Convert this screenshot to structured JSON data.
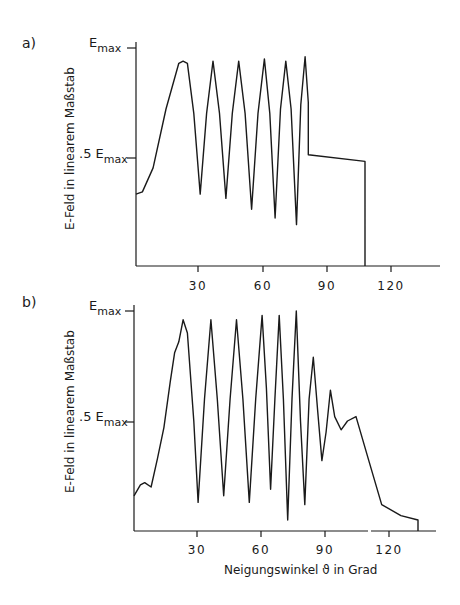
{
  "figure": {
    "panel_a": {
      "label": "a)",
      "y_axis_label": "E-Feld in linearem Maßstab",
      "y_tick_top": "E",
      "y_tick_top_sub": "max",
      "y_tick_mid": ".5 E",
      "y_tick_mid_sub": "max",
      "x_ticks": [
        "30",
        "60",
        "90",
        "120"
      ]
    },
    "panel_b": {
      "label": "b)",
      "y_axis_label": "E-Feld in linearem Maßstab",
      "y_tick_top": "E",
      "y_tick_top_sub": "max",
      "y_tick_mid": ".5 E",
      "y_tick_mid_sub": "max",
      "x_ticks": [
        "30",
        "60",
        "90",
        "120"
      ],
      "x_axis_label": "Neigungswinkel ϑ in Grad"
    }
  },
  "chart_data": [
    {
      "type": "line",
      "title": "a)",
      "xlabel": "",
      "ylabel": "E-Feld in linearem Maßstab",
      "yticks": [
        "E_max",
        ".5 E_max"
      ],
      "xticks": [
        30,
        60,
        90,
        120
      ],
      "xlim": [
        0,
        140
      ],
      "ylim": [
        0,
        1.0
      ],
      "grid": false,
      "series": [
        {
          "name": "E-Feld",
          "x": [
            0,
            3,
            8,
            14,
            20,
            22,
            24,
            27,
            30,
            33,
            36,
            39,
            42,
            45,
            48,
            51,
            54,
            57,
            60,
            62.5,
            65,
            67.5,
            70,
            72.5,
            75,
            77,
            79,
            80.5,
            80.5,
            107,
            107
          ],
          "y": [
            0.33,
            0.34,
            0.45,
            0.72,
            0.93,
            0.94,
            0.93,
            0.7,
            0.33,
            0.7,
            0.94,
            0.7,
            0.31,
            0.7,
            0.94,
            0.7,
            0.26,
            0.7,
            0.95,
            0.7,
            0.22,
            0.72,
            0.94,
            0.72,
            0.19,
            0.74,
            0.96,
            0.75,
            0.51,
            0.48,
            0.0
          ]
        }
      ]
    },
    {
      "type": "line",
      "title": "b)",
      "xlabel": "Neigungswinkel ϑ in Grad",
      "ylabel": "E-Feld in linearem Maßstab",
      "yticks": [
        "E_max",
        ".5 E_max"
      ],
      "xticks": [
        30,
        60,
        90,
        120
      ],
      "xlim": [
        0,
        140
      ],
      "ylim": [
        0,
        1.0
      ],
      "grid": false,
      "series": [
        {
          "name": "E-Feld",
          "x": [
            0,
            3,
            5,
            8,
            11,
            14,
            17,
            19,
            21,
            23,
            25,
            28,
            30,
            33,
            36,
            39,
            42,
            45,
            48,
            51,
            54,
            57,
            60,
            62,
            64,
            66,
            68,
            70,
            72,
            74,
            76,
            78,
            80,
            82,
            84,
            86,
            88,
            90,
            92,
            94,
            97,
            100,
            104,
            110,
            116,
            125,
            133,
            133
          ],
          "y": [
            0.16,
            0.21,
            0.22,
            0.2,
            0.33,
            0.47,
            0.68,
            0.81,
            0.86,
            0.96,
            0.9,
            0.5,
            0.13,
            0.6,
            0.96,
            0.6,
            0.16,
            0.6,
            0.96,
            0.6,
            0.13,
            0.6,
            0.98,
            0.65,
            0.19,
            0.6,
            0.98,
            0.6,
            0.05,
            0.6,
            1.0,
            0.5,
            0.12,
            0.6,
            0.79,
            0.55,
            0.32,
            0.45,
            0.64,
            0.52,
            0.46,
            0.5,
            0.52,
            0.32,
            0.12,
            0.07,
            0.05,
            0.0
          ]
        }
      ]
    }
  ]
}
